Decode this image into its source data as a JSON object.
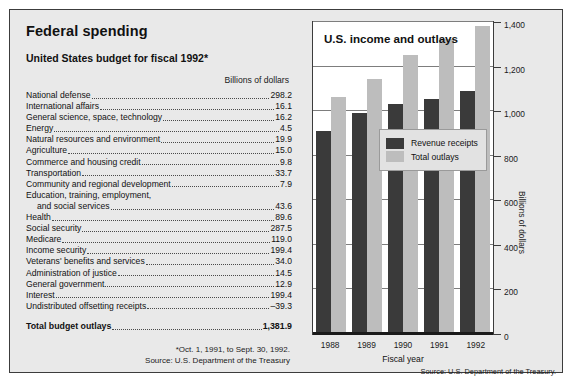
{
  "page_title": "Federal spending",
  "table": {
    "title": "United States budget for fiscal 1992*",
    "units_label": "Billions of dollars",
    "rows": [
      {
        "name": "National defense",
        "value": "298.2"
      },
      {
        "name": "International affairs",
        "value": "16.1"
      },
      {
        "name": "General science, space, technology",
        "value": "16.2"
      },
      {
        "name": "Energy",
        "value": "4.5"
      },
      {
        "name": "Natural resources and environment",
        "value": "19.9"
      },
      {
        "name": "Agriculture",
        "value": "15.0"
      },
      {
        "name": "Commerce and housing credit",
        "value": "9.8"
      },
      {
        "name": "Transportation",
        "value": "33.7"
      },
      {
        "name": "Community and regional development",
        "value": "7.9"
      },
      {
        "name": "Education, training, employment,",
        "value": "",
        "nodots": true
      },
      {
        "name": "and social services",
        "value": "43.6",
        "continuation": true
      },
      {
        "name": "Health",
        "value": "89.6"
      },
      {
        "name": "Social security",
        "value": "287.5"
      },
      {
        "name": "Medicare",
        "value": "119.0"
      },
      {
        "name": "Income security",
        "value": "199.4"
      },
      {
        "name": "Veterans' benefits and services",
        "value": "34.0"
      },
      {
        "name": "Administration of justice",
        "value": "14.5"
      },
      {
        "name": "General government",
        "value": "12.9"
      },
      {
        "name": "Interest",
        "value": "199.4"
      },
      {
        "name": "Undistributed offsetting receipts",
        "value": "–39.3"
      }
    ],
    "total": {
      "name": "Total budget outlays",
      "value": "1,381.9"
    },
    "footnote": "*Oct. 1, 1991, to Sept. 30, 1992.",
    "source": "Source: U.S. Department of the Treasury"
  },
  "chart_source": "Source: U.S. Department of the Treasury.",
  "colors": {
    "revenue": "#3a3a3a",
    "outlays": "#bdbdbd",
    "panel_background": "#e9e9e9",
    "plot_background": "#ffffff",
    "border": "#3c3c3c"
  },
  "chart_data": {
    "type": "bar",
    "title": "U.S. income and outlays",
    "xlabel": "Fiscal year",
    "ylabel": "Billions of dollars",
    "categories": [
      "1988",
      "1989",
      "1990",
      "1991",
      "1992"
    ],
    "series": [
      {
        "name": "Revenue receipts",
        "values": [
          909,
          991,
          1031,
          1054,
          1091
        ]
      },
      {
        "name": "Total outlays",
        "values": [
          1064,
          1143,
          1253,
          1323,
          1382
        ]
      }
    ],
    "ylim": [
      0,
      1400
    ],
    "yticks": [
      0,
      200,
      400,
      600,
      800,
      1000,
      1200,
      1400
    ],
    "ytick_labels": [
      "0",
      "200",
      "400",
      "600",
      "800",
      "1,000",
      "1,200",
      "1,400"
    ],
    "grid": true,
    "legend_position": "center"
  }
}
